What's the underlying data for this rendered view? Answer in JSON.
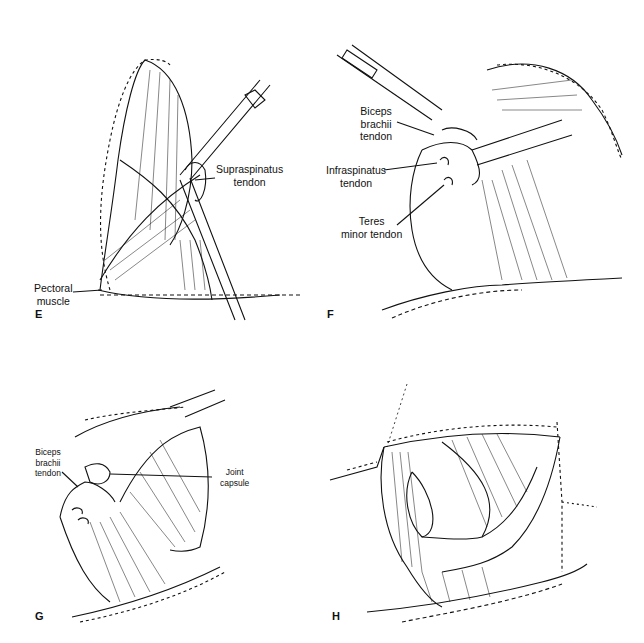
{
  "figure": {
    "panels": [
      {
        "id": "E",
        "letter": "E",
        "labels": [
          {
            "text": "Supraspinatus\ntendon"
          },
          {
            "text": "Pectoral\nmuscle"
          }
        ]
      },
      {
        "id": "F",
        "letter": "F",
        "labels": [
          {
            "text": "Biceps\nbrachii\ntendon"
          },
          {
            "text": "Infraspinatus\ntendon"
          },
          {
            "text": "Teres\nminor tendon"
          }
        ]
      },
      {
        "id": "G",
        "letter": "G",
        "labels": [
          {
            "text": "Biceps\nbrachii\ntendon"
          },
          {
            "text": "Joint\ncapsule"
          }
        ]
      },
      {
        "id": "H",
        "letter": "H",
        "labels": []
      }
    ]
  }
}
